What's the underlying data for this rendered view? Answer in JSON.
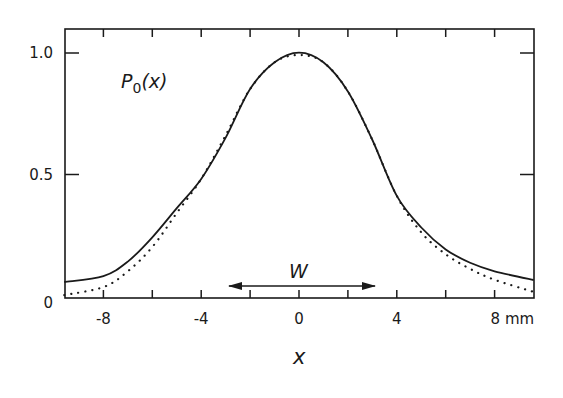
{
  "chart_data": {
    "type": "line",
    "title": "",
    "xlabel": "x",
    "ylabel": "",
    "x_unit": "mm",
    "xlim": [
      -9.6,
      9.6
    ],
    "ylim": [
      0,
      1.1
    ],
    "grid": false,
    "legend": null,
    "x_ticks": [
      -8,
      -6,
      -4,
      -2,
      0,
      2,
      4,
      6,
      8
    ],
    "x_tick_labels": [
      {
        "value": -8,
        "label": "-8"
      },
      {
        "value": -4,
        "label": "-4"
      },
      {
        "value": 0,
        "label": "0"
      },
      {
        "value": 4,
        "label": "4"
      },
      {
        "value": 8,
        "label": "8 mm"
      }
    ],
    "y_ticks": [
      0,
      0.5,
      1.0
    ],
    "y_tick_labels": [
      {
        "value": 0,
        "label": "0"
      },
      {
        "value": 0.5,
        "label": "0.5"
      },
      {
        "value": 1.0,
        "label": "1.0"
      }
    ],
    "series": [
      {
        "name": "measured",
        "style": "solid",
        "x": [
          -9.6,
          -8,
          -7,
          -6,
          -5,
          -4,
          -3,
          -2,
          -1,
          0,
          1,
          2,
          3,
          4,
          5,
          6,
          7,
          8,
          9.6
        ],
        "values": [
          0.066,
          0.09,
          0.15,
          0.25,
          0.37,
          0.49,
          0.66,
          0.86,
          0.97,
          1.01,
          0.97,
          0.85,
          0.65,
          0.42,
          0.29,
          0.2,
          0.145,
          0.11,
          0.074
        ]
      },
      {
        "name": "fit",
        "style": "dotted",
        "x": [
          -9.6,
          -8,
          -7,
          -6,
          -5,
          -4,
          -3,
          -2,
          -1,
          0,
          1,
          2,
          3,
          4,
          5,
          6,
          7,
          8,
          9.6
        ],
        "values": [
          0.012,
          0.045,
          0.11,
          0.21,
          0.35,
          0.49,
          0.67,
          0.86,
          0.97,
          1.0,
          0.97,
          0.85,
          0.65,
          0.42,
          0.27,
          0.18,
          0.12,
          0.075,
          0.025
        ]
      }
    ],
    "annotations": [
      {
        "text": "P0(x)",
        "subscript": "0",
        "base": "P",
        "arg": "(x)",
        "at": [
          -7.3,
          0.85
        ]
      },
      {
        "text": "W",
        "type": "double-arrow",
        "from": -2.9,
        "to": 3.1,
        "y": 0.05
      }
    ]
  },
  "labels": {
    "curve_label_base": "P",
    "curve_label_sub": "0",
    "curve_label_arg": "(x)",
    "width_label": "W",
    "x_axis_label": "x"
  },
  "colors": {
    "ink": "#1a1a1a",
    "background": "#ffffff"
  }
}
